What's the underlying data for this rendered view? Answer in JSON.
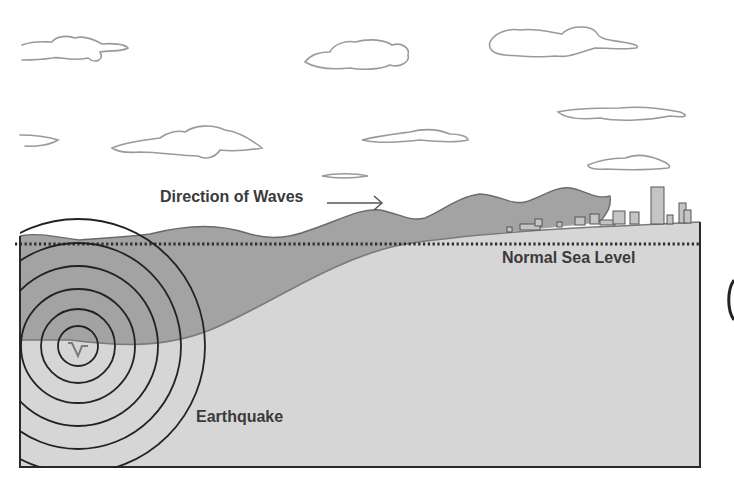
{
  "diagram": {
    "labels": {
      "direction": "Direction of Waves",
      "sea_level": "Normal Sea Level",
      "earthquake": "Earthquake"
    },
    "colors": {
      "sky": "#ffffff",
      "water": "#a3a3a3",
      "land": "#d6d6d6",
      "outline": "#2a2a2a",
      "text": "#3a3a3a",
      "cloud_stroke": "#9a9a9a"
    },
    "elements": [
      "clouds",
      "tsunami-wave",
      "city-skyline",
      "sea-level-dotted-line",
      "seismic-rings",
      "fault-rupture",
      "direction-arrow"
    ]
  }
}
